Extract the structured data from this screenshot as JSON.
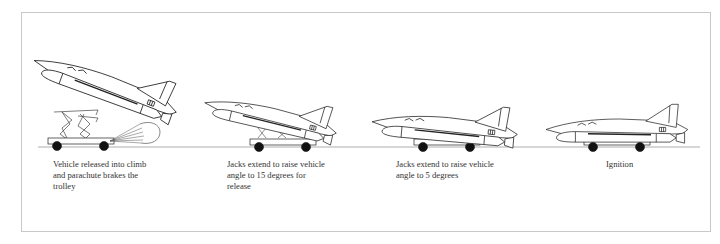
{
  "diagram": {
    "stages": [
      {
        "id": "stage-1",
        "caption": "Vehicle released into climb\nand parachute brakes the\ntrolley"
      },
      {
        "id": "stage-2",
        "caption": "Jacks extend to raise vehicle\nangle to 15 degrees for\nrelease"
      },
      {
        "id": "stage-3",
        "caption": "Jacks extend to raise vehicle\nangle to 5 degrees"
      },
      {
        "id": "stage-4",
        "caption": "Ignition"
      }
    ],
    "colors": {
      "line": "#222222",
      "frame": "#c8c8c8",
      "ground": "#9a9a9a",
      "wheel": "#111111"
    }
  }
}
